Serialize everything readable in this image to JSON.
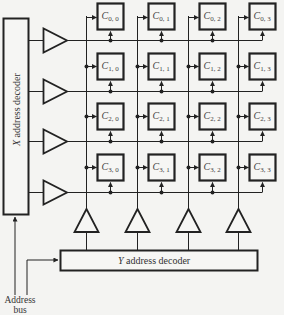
{
  "diagram": {
    "type": "memory-array-2d-decoding",
    "rows": 4,
    "cols": 4,
    "cells": [
      [
        "C",
        "0, 0",
        "0, 1",
        "0, 2",
        "0, 3"
      ],
      [
        "C",
        "1, 0",
        "1, 1",
        "1, 2",
        "1, 3"
      ],
      [
        "C",
        "2, 0",
        "2, 1",
        "2, 2",
        "2, 3"
      ],
      [
        "C",
        "3, 0",
        "3, 1",
        "3, 2",
        "3, 3"
      ]
    ],
    "cell_symbol": "C",
    "cell_labels": [
      [
        "0, 0",
        "0, 1",
        "0, 2",
        "0, 3"
      ],
      [
        "1, 0",
        "1, 1",
        "1, 2",
        "1, 3"
      ],
      [
        "2, 0",
        "2, 1",
        "2, 2",
        "2, 3"
      ],
      [
        "3, 0",
        "3, 1",
        "3, 2",
        "3, 3"
      ]
    ],
    "x_decoder": {
      "label_prefix": "X",
      "label_rest": " address decoder"
    },
    "y_decoder": {
      "label_prefix": "Y",
      "label_rest": " address decoder"
    },
    "address_bus": {
      "line1": "Address",
      "line2": "bus"
    },
    "colors": {
      "ink": "#222222",
      "paper": "#f4f4f2"
    }
  }
}
